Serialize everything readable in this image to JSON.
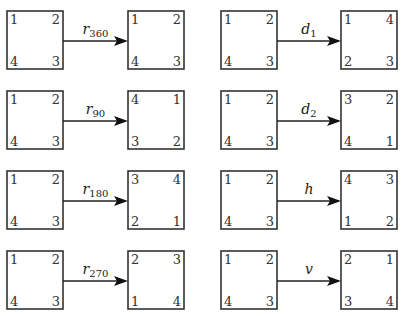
{
  "source_square": {
    "top_left": "1",
    "top_right": "2",
    "bottom_left": "4",
    "bottom_right": "3"
  },
  "transformations": [
    {
      "name": "r",
      "subscript": "360",
      "result": {
        "top_left": "1",
        "top_right": "2",
        "bottom_left": "4",
        "bottom_right": "3"
      }
    },
    {
      "name": "r",
      "subscript": "90",
      "result": {
        "top_left": "4",
        "top_right": "1",
        "bottom_left": "3",
        "bottom_right": "2"
      }
    },
    {
      "name": "r",
      "subscript": "180",
      "result": {
        "top_left": "3",
        "top_right": "4",
        "bottom_left": "2",
        "bottom_right": "1"
      }
    },
    {
      "name": "r",
      "subscript": "270",
      "result": {
        "top_left": "2",
        "top_right": "3",
        "bottom_left": "1",
        "bottom_right": "4"
      }
    },
    {
      "name": "d",
      "subscript": "1",
      "result": {
        "top_left": "1",
        "top_right": "4",
        "bottom_left": "2",
        "bottom_right": "3"
      }
    },
    {
      "name": "d",
      "subscript": "2",
      "result": {
        "top_left": "3",
        "top_right": "2",
        "bottom_left": "4",
        "bottom_right": "1"
      }
    },
    {
      "name": "h",
      "subscript": "",
      "result": {
        "top_left": "4",
        "top_right": "3",
        "bottom_left": "1",
        "bottom_right": "2"
      }
    },
    {
      "name": "v",
      "subscript": "",
      "result": {
        "top_left": "2",
        "top_right": "1",
        "bottom_left": "3",
        "bottom_right": "4"
      }
    }
  ]
}
